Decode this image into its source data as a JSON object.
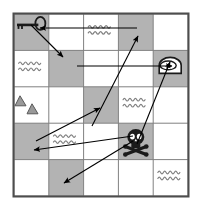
{
  "map": {
    "title": "Treasure Map Grid",
    "grid": {
      "rows": 5,
      "cols": 5,
      "origin_x": 14,
      "origin_y": 14,
      "cell_w": 34.8,
      "cell_h": 36.4
    },
    "colors": {
      "land": "#ffffff",
      "shaded": "#b3b3b3",
      "grid_line": "#808080",
      "border": "#4d4d4d",
      "icon_dark": "#1a1a1a",
      "icon_mid": "#999999",
      "wave": "#808080",
      "arrow": "#000000"
    },
    "cells": [
      {
        "row": 1,
        "col": 1,
        "fill": "shaded",
        "icon": "key-icon"
      },
      {
        "row": 1,
        "col": 2,
        "fill": "land",
        "icon": "none"
      },
      {
        "row": 1,
        "col": 3,
        "fill": "land",
        "icon": "waves-icon"
      },
      {
        "row": 1,
        "col": 4,
        "fill": "shaded",
        "icon": "none"
      },
      {
        "row": 1,
        "col": 5,
        "fill": "land",
        "icon": "none"
      },
      {
        "row": 2,
        "col": 1,
        "fill": "land",
        "icon": "waves-icon"
      },
      {
        "row": 2,
        "col": 2,
        "fill": "shaded",
        "icon": "none"
      },
      {
        "row": 2,
        "col": 3,
        "fill": "land",
        "icon": "none"
      },
      {
        "row": 2,
        "col": 4,
        "fill": "land",
        "icon": "none"
      },
      {
        "row": 2,
        "col": 5,
        "fill": "shaded",
        "icon": "cave-icon"
      },
      {
        "row": 3,
        "col": 1,
        "fill": "land",
        "icon": "mountains-icon"
      },
      {
        "row": 3,
        "col": 2,
        "fill": "land",
        "icon": "none"
      },
      {
        "row": 3,
        "col": 3,
        "fill": "shaded",
        "icon": "none"
      },
      {
        "row": 3,
        "col": 4,
        "fill": "land",
        "icon": "waves-icon"
      },
      {
        "row": 3,
        "col": 5,
        "fill": "land",
        "icon": "none"
      },
      {
        "row": 4,
        "col": 1,
        "fill": "shaded",
        "icon": "none"
      },
      {
        "row": 4,
        "col": 2,
        "fill": "land",
        "icon": "waves-icon"
      },
      {
        "row": 4,
        "col": 3,
        "fill": "land",
        "icon": "none"
      },
      {
        "row": 4,
        "col": 4,
        "fill": "shaded",
        "icon": "skull-icon"
      },
      {
        "row": 4,
        "col": 5,
        "fill": "land",
        "icon": "none"
      },
      {
        "row": 5,
        "col": 1,
        "fill": "land",
        "icon": "none"
      },
      {
        "row": 5,
        "col": 2,
        "fill": "shaded",
        "icon": "none"
      },
      {
        "row": 5,
        "col": 3,
        "fill": "land",
        "icon": "none"
      },
      {
        "row": 5,
        "col": 4,
        "fill": "land",
        "icon": "none"
      },
      {
        "row": 5,
        "col": 5,
        "fill": "land",
        "icon": "waves-icon"
      }
    ],
    "arrows": [
      {
        "name": "arrow-to-key",
        "from": [
          137,
          28
        ],
        "to": [
          40,
          28
        ],
        "head": "end"
      },
      {
        "name": "arrow-key-diagonal",
        "from": [
          31,
          25
        ],
        "to": [
          63,
          57
        ],
        "head": "end"
      },
      {
        "name": "arrow-to-cave",
        "from": [
          77,
          66
        ],
        "to": [
          172,
          66
        ],
        "head": "end"
      },
      {
        "name": "arrow-up-right",
        "from": [
          92,
          126
        ],
        "to": [
          138,
          36
        ],
        "head": "end"
      },
      {
        "name": "arrow-mid-right",
        "from": [
          36,
          141
        ],
        "to": [
          100,
          108
        ],
        "head": "end"
      },
      {
        "name": "arrow-to-lowleft",
        "from": [
          133,
          136
        ],
        "to": [
          34,
          150
        ],
        "head": "end"
      },
      {
        "name": "arrow-skull-cave",
        "from": [
          137,
          144
        ],
        "to": [
          170,
          62
        ],
        "head": "end"
      },
      {
        "name": "arrow-down-left",
        "from": [
          133,
          141
        ],
        "to": [
          64,
          183
        ],
        "head": "end"
      }
    ]
  }
}
